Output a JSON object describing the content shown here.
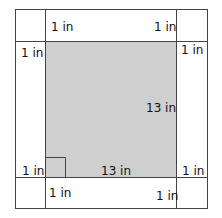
{
  "diagram": {
    "type": "square-with-border-cutouts",
    "inner_square": {
      "fill": "#cfcfcf",
      "width_label": "13 in",
      "height_label": "13 in",
      "right_angle_marker": true
    },
    "labels": {
      "top_left": "1 in",
      "top_right": "1 in",
      "left_top": "1 in",
      "right_top": "1 in",
      "left_bottom": "1 in",
      "right_bottom": "1 in",
      "bottom_left": "1 in",
      "bottom_right": "1 in",
      "inner_height": "13 in",
      "inner_width": "13 in"
    },
    "colors": {
      "line": "#444444",
      "inner_fill": "#cfcfcf",
      "background": "#ffffff"
    }
  }
}
